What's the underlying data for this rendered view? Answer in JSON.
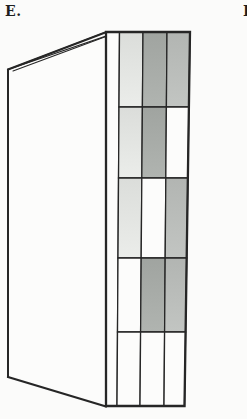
{
  "labels": {
    "panel": "E.",
    "next_panel_partial": "F"
  },
  "figure": {
    "grid": {
      "rows": 5,
      "cols": 3,
      "pattern": [
        [
          "light",
          "dark",
          "medium"
        ],
        [
          "light",
          "dark",
          "white"
        ],
        [
          "light",
          "white",
          "medium"
        ],
        [
          "white",
          "dark",
          "medium"
        ],
        [
          "white",
          "white",
          "white"
        ]
      ]
    },
    "palette": {
      "light": "#e3e5e2",
      "dark": "#a8aca8",
      "medium": "#babdba",
      "white": "#fcfcfb",
      "line": "#262626",
      "background": "#fbfbfa"
    }
  }
}
